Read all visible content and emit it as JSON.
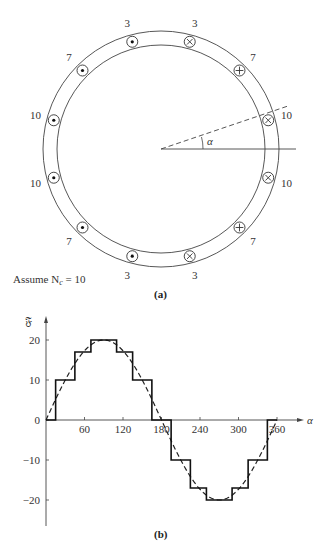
{
  "figure_a": {
    "caption": "(a)",
    "assume_text": "Assume N",
    "assume_sub": "c",
    "assume_value": " = 10",
    "angle_label": "α",
    "slots": [
      {
        "type": "dot",
        "turns": "3",
        "angle": 105
      },
      {
        "type": "cross",
        "turns": "3",
        "angle": 75
      },
      {
        "type": "dot",
        "turns": "7",
        "angle": 135
      },
      {
        "type": "cross",
        "turns": "7",
        "angle": 45
      },
      {
        "type": "dot",
        "turns": "10",
        "angle": 165
      },
      {
        "type": "cross",
        "turns": "10",
        "angle": 15
      },
      {
        "type": "dot",
        "turns": "10",
        "angle": 195
      },
      {
        "type": "cross",
        "turns": "10",
        "angle": 345
      },
      {
        "type": "dot",
        "turns": "7",
        "angle": 225
      },
      {
        "type": "cross",
        "turns": "7",
        "angle": 315
      },
      {
        "type": "dot",
        "turns": "3",
        "angle": 255
      },
      {
        "type": "cross",
        "turns": "3",
        "angle": 285
      }
    ]
  },
  "figure_b": {
    "caption": "(b)"
  },
  "chart_data": {
    "type": "line",
    "title": "",
    "xlabel": "α",
    "ylabel": "𝔉",
    "xticks": [
      60,
      120,
      180,
      240,
      300,
      360
    ],
    "yticks": [
      -20,
      -10,
      0,
      10,
      20
    ],
    "xlim": [
      0,
      370
    ],
    "ylim": [
      -25,
      25
    ],
    "series": [
      {
        "name": "stepped MMF",
        "style": "solid",
        "x": [
          0,
          15,
          15,
          45,
          45,
          70,
          70,
          110,
          110,
          135,
          135,
          165,
          165,
          195,
          195,
          225,
          225,
          250,
          250,
          290,
          290,
          315,
          315,
          345,
          345,
          360
        ],
        "y": [
          0,
          0,
          10,
          10,
          17,
          17,
          20,
          20,
          17,
          17,
          10,
          10,
          0,
          0,
          -10,
          -10,
          -17,
          -17,
          -20,
          -20,
          -17,
          -17,
          -10,
          -10,
          0,
          0
        ]
      },
      {
        "name": "fundamental sinusoid",
        "style": "dashed",
        "amplitude": 20,
        "phase_shift": 0,
        "period": 360
      }
    ]
  }
}
